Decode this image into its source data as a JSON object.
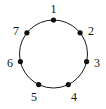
{
  "figure": {
    "title": "",
    "kind": "cycle-graph",
    "background_color": "#ffffff",
    "canvas": {
      "width": 106,
      "height": 109
    }
  },
  "chart_data": {
    "type": "scatter",
    "title": "",
    "xlabel": "",
    "ylabel": "",
    "grid": false,
    "legend": false,
    "geometry": {
      "center_x": 53.5,
      "center_y": 54,
      "radius": 34,
      "vertex_count": 7,
      "start_angle_deg": -90,
      "direction": "clockwise"
    },
    "style": {
      "circle_stroke": "#1a1a1a",
      "circle_stroke_width": 1,
      "circle_fill": "none",
      "node_fill": "#111111",
      "node_radius": 2.6,
      "label_color": "#111111",
      "label_font_size": 12
    },
    "categories": [
      "1",
      "2",
      "3",
      "4",
      "5",
      "6",
      "7"
    ],
    "values": [
      1,
      2,
      3,
      4,
      5,
      6,
      7
    ],
    "nodes": [
      {
        "label": "1",
        "angle_deg": -90.0,
        "x": 53.5,
        "y": 20.0,
        "label_x": 53.5,
        "label_y": 9.0
      },
      {
        "label": "2",
        "angle_deg": -38.6,
        "x": 80.1,
        "y": 32.8,
        "label_x": 91.0,
        "label_y": 31.0
      },
      {
        "label": "3",
        "angle_deg": 12.9,
        "x": 86.6,
        "y": 61.6,
        "label_x": 97.0,
        "label_y": 63.0
      },
      {
        "label": "4",
        "angle_deg": 64.3,
        "x": 68.3,
        "y": 84.6,
        "label_x": 74.0,
        "label_y": 97.0
      },
      {
        "label": "5",
        "angle_deg": 115.7,
        "x": 38.7,
        "y": 84.6,
        "label_x": 34.0,
        "label_y": 97.0
      },
      {
        "label": "6",
        "angle_deg": 167.1,
        "x": 20.4,
        "y": 61.6,
        "label_x": 10.0,
        "label_y": 63.0
      },
      {
        "label": "7",
        "angle_deg": 218.6,
        "x": 26.9,
        "y": 32.8,
        "label_x": 16.0,
        "label_y": 31.0
      }
    ],
    "edges": [
      [
        "1",
        "2"
      ],
      [
        "2",
        "3"
      ],
      [
        "3",
        "4"
      ],
      [
        "4",
        "5"
      ],
      [
        "5",
        "6"
      ],
      [
        "6",
        "7"
      ],
      [
        "7",
        "1"
      ]
    ]
  }
}
